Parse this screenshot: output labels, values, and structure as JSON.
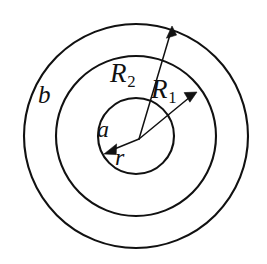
{
  "figure": {
    "background_color": "#ffffff",
    "stroke_color": "#111111",
    "center": {
      "x": 136,
      "y": 136
    },
    "arrow_origin": {
      "x": 139,
      "y": 139
    },
    "circles": [
      {
        "name": "inner-circle",
        "radius": 38
      },
      {
        "name": "middle-circle",
        "radius": 80
      },
      {
        "name": "outer-circle",
        "radius": 112
      }
    ],
    "arrows": [
      {
        "name": "radius-arrow-R2",
        "tip_x": 172,
        "tip_y": 28
      },
      {
        "name": "radius-arrow-R1",
        "tip_x": 197,
        "tip_y": 93
      },
      {
        "name": "radius-arrow-r",
        "tip_x": 105,
        "tip_y": 152
      }
    ],
    "labels": {
      "outer_region": "b",
      "radius_two": "R",
      "radius_two_sub": "2",
      "radius_one": "R",
      "radius_one_sub": "1",
      "inner_region": "a",
      "variable_radius": "r"
    }
  }
}
